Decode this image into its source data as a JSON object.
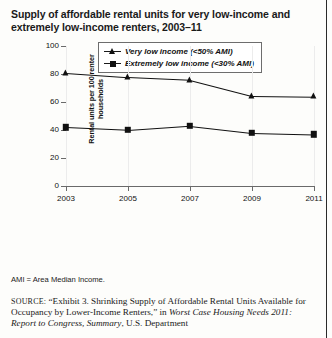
{
  "title": "Supply of affordable rental units for very low-income and extremely low-income renters, 2003–11",
  "footnote": "AMI = Area Median Income.",
  "source": {
    "label": "SOURCE:",
    "text_1": " “Exhibit 3. Shrinking Supply of Affordable Rental Units Available for Occupancy by Lower-Income Renters,” in ",
    "italic_1": "Worst Case Housing Needs 2011: Report to Congress, Summary",
    "text_2": ", U.S. Department"
  },
  "chart_data": {
    "type": "line",
    "title": "Supply of affordable rental units for very low-income and extremely low-income renters, 2003–11",
    "xlabel": "",
    "ylabel": "Rental units per 100 renter households",
    "categories": [
      "2003",
      "2005",
      "2007",
      "2009",
      "2011"
    ],
    "x": [
      2003,
      2005,
      2007,
      2009,
      2011
    ],
    "xlim": [
      2003,
      2011
    ],
    "ylim": [
      0,
      100
    ],
    "yticks": [
      0,
      20,
      40,
      60,
      80,
      100
    ],
    "ytick_labels": [
      "0",
      "20",
      "40",
      "60",
      "80",
      "100"
    ],
    "xtick_labels": [
      "2003",
      "2005",
      "2007",
      "2009",
      "2011"
    ],
    "grid": false,
    "legend_position": "top-center",
    "series": [
      {
        "name": "Very low income (<50% AMI)",
        "marker": "triangle",
        "color": "#111111",
        "values": [
          81,
          78,
          76,
          64.5,
          64
        ]
      },
      {
        "name": "Extremely low income (<30% AMI)",
        "marker": "square",
        "color": "#111111",
        "values": [
          42,
          40,
          43,
          38,
          37
        ]
      }
    ]
  }
}
